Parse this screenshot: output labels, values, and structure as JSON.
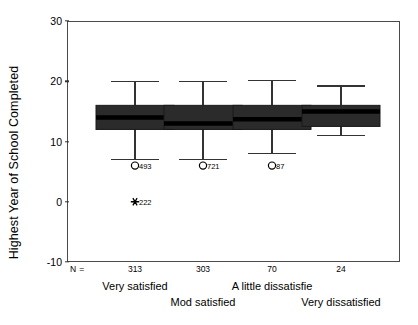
{
  "chart_data": {
    "type": "box",
    "title": "",
    "xlabel": "",
    "ylabel": "Highest Year of School Completed",
    "ylim": [
      -10,
      30
    ],
    "yticks": [
      30,
      20,
      10,
      0,
      -10
    ],
    "ytick_labels": [
      "30",
      "20",
      "10",
      "0",
      "-10"
    ],
    "grid": false,
    "legend": "none",
    "n_row_label": "N =",
    "categories": [
      "Very satisfied",
      "Mod satisfied",
      "A little dissatisfie",
      "Very dissatisfied"
    ],
    "n_values": [
      "313",
      "303",
      "70",
      "24"
    ],
    "boxes": [
      {
        "category": "Very satisfied",
        "n": 313,
        "whisker_low": 7,
        "q1": 12,
        "median": 14,
        "q3": 16,
        "whisker_high": 20,
        "outliers": [
          {
            "value": 6,
            "marker": "circle",
            "label": "493"
          },
          {
            "value": 0,
            "marker": "star",
            "label": "222"
          }
        ]
      },
      {
        "category": "Mod satisfied",
        "n": 303,
        "whisker_low": 7,
        "q1": 12,
        "median": 13,
        "q3": 16,
        "whisker_high": 20,
        "outliers": [
          {
            "value": 6,
            "marker": "circle",
            "label": "721"
          }
        ]
      },
      {
        "category": "A little dissatisfie",
        "n": 70,
        "whisker_low": 8,
        "q1": 12,
        "median": 13.7,
        "q3": 16,
        "whisker_high": 20.1,
        "outliers": [
          {
            "value": 6,
            "marker": "circle",
            "label": "87"
          }
        ]
      },
      {
        "category": "Very dissatisfied",
        "n": 24,
        "whisker_low": 11,
        "q1": 12.5,
        "median": 15,
        "q3": 16,
        "whisker_high": 19.2,
        "outliers": []
      }
    ],
    "colors": {
      "box_fill": "#2b2b2b",
      "box_edge": "#1a1a1a",
      "median": "#000000",
      "whisker": "#333333",
      "axis": "#4a4a4a",
      "text": "#000000",
      "background": "#ffffff"
    }
  }
}
